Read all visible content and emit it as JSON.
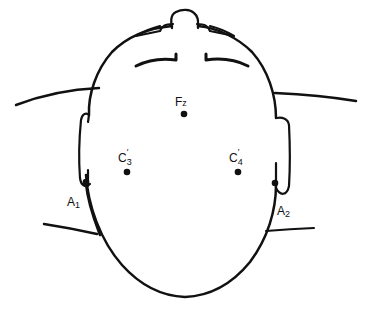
{
  "diagram": {
    "type": "eeg-electrode-placement",
    "view": "top of head",
    "stroke_color": "#111111",
    "background": "#ffffff",
    "electrodes": [
      {
        "id": "fz",
        "label": "F",
        "sub": "z",
        "prime": "",
        "x": 184,
        "y": 114,
        "lx": 175,
        "ly": 106
      },
      {
        "id": "c3p",
        "label": "C",
        "sub": "3",
        "prime": "′",
        "x": 127,
        "y": 172,
        "lx": 118,
        "ly": 162
      },
      {
        "id": "c4p",
        "label": "C",
        "sub": "4",
        "prime": "′",
        "x": 238,
        "y": 172,
        "lx": 229,
        "ly": 162
      },
      {
        "id": "a1",
        "label": "A",
        "sub": "1",
        "prime": "",
        "x": 86,
        "y": 182,
        "lx": 67,
        "ly": 206
      },
      {
        "id": "a2",
        "label": "A",
        "sub": "2",
        "prime": "",
        "x": 275,
        "y": 183,
        "lx": 277,
        "ly": 215
      }
    ]
  }
}
